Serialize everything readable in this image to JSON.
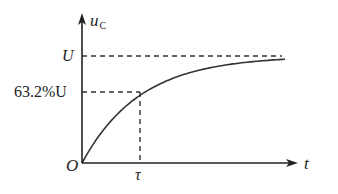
{
  "chart_data": {
    "type": "line",
    "title": "",
    "xlabel": "t",
    "ylabel": "u",
    "ylabel_subscript": "C",
    "x_ticks": [
      {
        "label": "O",
        "value": 0
      },
      {
        "label": "τ",
        "value": 1
      }
    ],
    "y_ticks": [
      {
        "label": "63.2%U",
        "value": 0.632
      },
      {
        "label": "U",
        "value": 1.0
      }
    ],
    "series": [
      {
        "name": "u_C(t) = U(1 - e^(-t/τ))",
        "style": "solid",
        "x": [
          0,
          0.25,
          0.5,
          0.75,
          1.0,
          1.5,
          2.0,
          2.5,
          3.0,
          3.5
        ],
        "values": [
          0,
          0.221,
          0.393,
          0.528,
          0.632,
          0.777,
          0.865,
          0.918,
          0.95,
          0.97
        ]
      },
      {
        "name": "asymptote U",
        "style": "dashed",
        "x": [
          0,
          3.5
        ],
        "values": [
          1.0,
          1.0
        ]
      }
    ],
    "annotations": [
      {
        "type": "dashed-guide",
        "from": [
          0,
          0.632
        ],
        "to": [
          1,
          0.632
        ]
      },
      {
        "type": "dashed-guide",
        "from": [
          1,
          0.632
        ],
        "to": [
          1,
          0
        ]
      }
    ],
    "xlim": [
      0,
      3.5
    ],
    "ylim": [
      0,
      1.15
    ],
    "grid": false,
    "legend": "none"
  },
  "labels": {
    "y_axis": "u",
    "y_axis_sub": "C",
    "x_axis": "t",
    "origin": "O",
    "tau": "τ",
    "U": "U",
    "U632": "63.2%U"
  },
  "colors": {
    "ink": "#222222",
    "background": "#ffffff"
  }
}
